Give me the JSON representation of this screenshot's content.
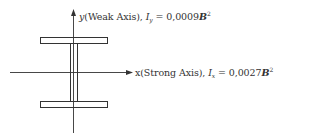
{
  "diagram": {
    "type": "I-beam cross section with principal axes",
    "stroke_color": "#333333",
    "y_axis": {
      "axis_letter": "y",
      "description": "(Weak Axis), ",
      "moment_symbol": "I",
      "moment_subscript": "y",
      "equals": " = ",
      "value": "0,0009",
      "variable": "B",
      "exponent": "2"
    },
    "x_axis": {
      "axis_letter": "x",
      "description": "(Strong Axis), ",
      "moment_symbol": "I",
      "moment_subscript": "x",
      "equals": " = ",
      "value": "0,0027",
      "variable": "B",
      "exponent": "2"
    }
  }
}
